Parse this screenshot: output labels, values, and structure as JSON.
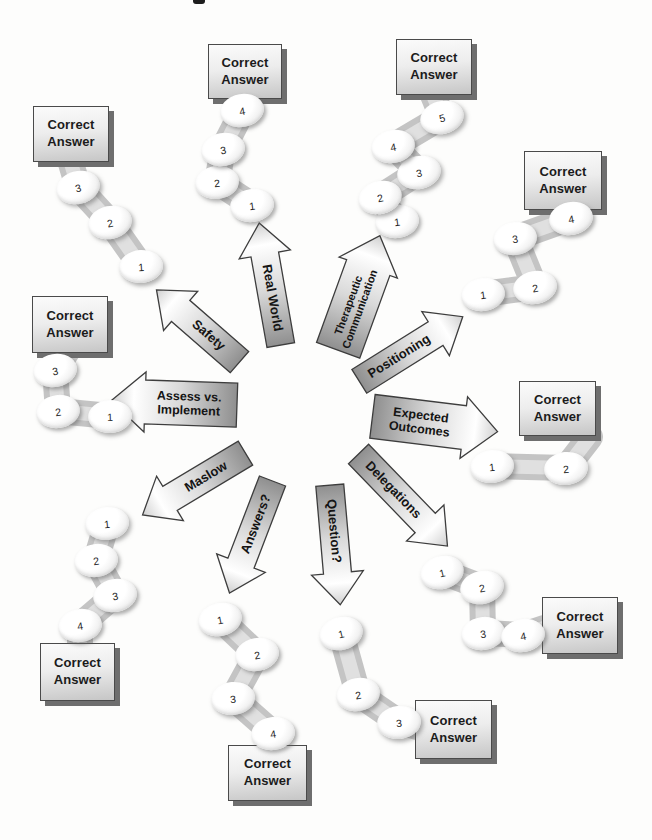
{
  "page": {
    "correct_answer_label": "Correct Answer"
  },
  "palette": {
    "ink": "#1b1b1b",
    "box_shadow": "#6e6e6e",
    "band": "#bfbfbf",
    "arrow_dark": "#8f8f8f",
    "paper": "#fdfdfc"
  },
  "strategies": [
    {
      "name": "safety",
      "label": "Safety",
      "steps": [
        "1",
        "2",
        "3"
      ]
    },
    {
      "name": "real-world",
      "label": "Real World",
      "steps": [
        "1",
        "2",
        "3",
        "4"
      ]
    },
    {
      "name": "therapeutic-communication",
      "label": "Therapeutic\nCommunication",
      "steps": [
        "1",
        "2",
        "3",
        "4",
        "5"
      ]
    },
    {
      "name": "positioning",
      "label": "Positioning",
      "steps": [
        "1",
        "2",
        "3",
        "4"
      ]
    },
    {
      "name": "expected-outcomes",
      "label": "Expected\nOutcomes",
      "steps": [
        "1",
        "2"
      ]
    },
    {
      "name": "delegations",
      "label": "Delegations",
      "steps": [
        "1",
        "2",
        "3",
        "4"
      ]
    },
    {
      "name": "question",
      "label": "Question?",
      "steps": [
        "1",
        "2",
        "3"
      ]
    },
    {
      "name": "answers",
      "label": "Answers?",
      "steps": [
        "1",
        "2",
        "3",
        "4"
      ]
    },
    {
      "name": "maslow",
      "label": "Maslow",
      "steps": [
        "1",
        "2",
        "3",
        "4"
      ]
    },
    {
      "name": "assess-vs-implement",
      "label": "Assess vs.\nImplement",
      "steps": [
        "1",
        "2",
        "3"
      ]
    }
  ]
}
